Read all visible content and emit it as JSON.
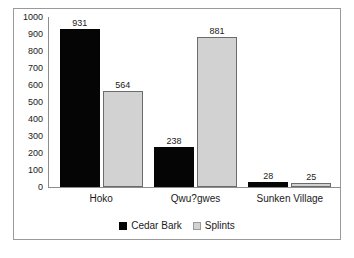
{
  "chart_data": {
    "type": "bar",
    "title": "",
    "subtitle": "",
    "xlabel": "",
    "ylabel": "",
    "categories": [
      "Hoko",
      "Qwu?gwes",
      "Sunken Village"
    ],
    "series": [
      {
        "name": "Cedar Bark",
        "color": "#050505",
        "values": [
          931,
          238,
          28
        ]
      },
      {
        "name": "Splints",
        "color": "#d2d2d2",
        "values": [
          564,
          881,
          25
        ]
      }
    ],
    "ylim": [
      0,
      1000
    ],
    "ytick_step": 100,
    "yticks": [
      1000,
      900,
      800,
      700,
      600,
      500,
      400,
      300,
      200,
      100,
      0
    ],
    "ytick_labels": [
      "1000",
      "900",
      "800",
      "700",
      "600",
      "500",
      "400",
      "300",
      "200",
      "100",
      "0"
    ],
    "data_labels": [
      [
        "931",
        "564"
      ],
      [
        "238",
        "881"
      ],
      [
        "28",
        "25"
      ]
    ],
    "grid": false,
    "legend_position": "bottom",
    "border_color": "#9a9a9a",
    "axis_color": "#8d8d8d",
    "background": "#ffffff"
  }
}
